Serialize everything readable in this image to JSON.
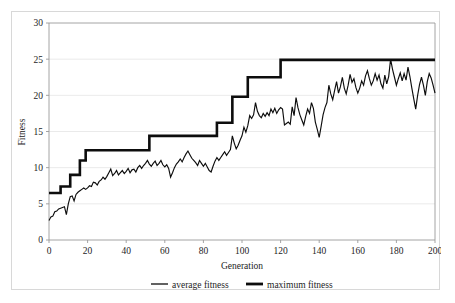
{
  "chart_data": {
    "type": "line",
    "title": "",
    "xlabel": "Generation",
    "ylabel": "Fitness",
    "xlim": [
      0,
      200
    ],
    "ylim": [
      0,
      30
    ],
    "xticks": [
      0,
      20,
      40,
      60,
      80,
      100,
      120,
      140,
      160,
      180,
      200
    ],
    "yticks": [
      0,
      5,
      10,
      15,
      20,
      25,
      30
    ],
    "grid": "horizontal",
    "legend_position": "bottom",
    "legend": [
      "average fitness",
      "maximum fitness"
    ],
    "x": [
      0,
      1,
      2,
      3,
      4,
      5,
      6,
      7,
      8,
      9,
      10,
      11,
      12,
      13,
      14,
      15,
      16,
      17,
      18,
      19,
      20,
      21,
      22,
      23,
      24,
      25,
      26,
      27,
      28,
      29,
      30,
      31,
      32,
      33,
      34,
      35,
      36,
      37,
      38,
      39,
      40,
      41,
      42,
      43,
      44,
      45,
      46,
      47,
      48,
      49,
      50,
      51,
      52,
      53,
      54,
      55,
      56,
      57,
      58,
      59,
      60,
      61,
      62,
      63,
      64,
      65,
      66,
      67,
      68,
      69,
      70,
      71,
      72,
      73,
      74,
      75,
      76,
      77,
      78,
      79,
      80,
      81,
      82,
      83,
      84,
      85,
      86,
      87,
      88,
      89,
      90,
      91,
      92,
      93,
      94,
      95,
      96,
      97,
      98,
      99,
      100,
      101,
      102,
      103,
      104,
      105,
      106,
      107,
      108,
      109,
      110,
      111,
      112,
      113,
      114,
      115,
      116,
      117,
      118,
      119,
      120,
      121,
      122,
      123,
      124,
      125,
      126,
      127,
      128,
      129,
      130,
      131,
      132,
      133,
      134,
      135,
      136,
      137,
      138,
      139,
      140,
      141,
      142,
      143,
      144,
      145,
      146,
      147,
      148,
      149,
      150,
      151,
      152,
      153,
      154,
      155,
      156,
      157,
      158,
      159,
      160,
      161,
      162,
      163,
      164,
      165,
      166,
      167,
      168,
      169,
      170,
      171,
      172,
      173,
      174,
      175,
      176,
      177,
      178,
      179,
      180,
      181,
      182,
      183,
      184,
      185,
      186,
      187,
      188,
      189,
      190,
      191,
      192,
      193,
      194,
      195,
      196,
      197,
      198,
      199,
      200
    ],
    "series": [
      {
        "name": "average fitness",
        "values": [
          2.7,
          3.2,
          3.3,
          3.9,
          4.0,
          4.3,
          4.4,
          4.5,
          4.6,
          3.5,
          5.0,
          6.0,
          6.1,
          5.4,
          6.3,
          6.6,
          6.8,
          7.0,
          7.2,
          7.0,
          7.2,
          7.5,
          7.4,
          8.0,
          7.9,
          7.6,
          8.1,
          8.3,
          8.7,
          8.4,
          8.8,
          9.3,
          9.8,
          8.9,
          9.2,
          9.6,
          9.0,
          9.3,
          9.6,
          9.2,
          9.5,
          9.9,
          9.3,
          9.7,
          9.8,
          9.4,
          10.0,
          10.3,
          9.9,
          10.3,
          10.6,
          11.0,
          10.5,
          10.2,
          10.6,
          10.9,
          10.3,
          10.6,
          11.0,
          10.4,
          10.1,
          10.4,
          9.9,
          8.7,
          9.3,
          10.0,
          10.5,
          10.8,
          11.2,
          10.8,
          11.4,
          11.9,
          12.3,
          11.8,
          11.3,
          11.0,
          10.7,
          10.3,
          11.0,
          10.6,
          10.2,
          10.6,
          10.1,
          9.6,
          9.4,
          10.2,
          10.9,
          11.4,
          11.0,
          11.4,
          11.8,
          12.2,
          11.7,
          12.1,
          12.5,
          14.4,
          13.4,
          12.6,
          13.1,
          13.8,
          14.4,
          15.6,
          14.9,
          15.8,
          17.2,
          16.8,
          17.3,
          19.0,
          17.8,
          17.2,
          16.9,
          17.5,
          17.1,
          17.6,
          17.2,
          18.1,
          17.6,
          18.2,
          17.5,
          18.0,
          18.3,
          18.1,
          15.9,
          16.1,
          16.3,
          16.0,
          18.4,
          17.2,
          19.7,
          18.3,
          17.3,
          16.6,
          15.9,
          17.1,
          18.1,
          17.5,
          19.0,
          18.2,
          16.3,
          15.3,
          14.2,
          15.7,
          17.3,
          18.3,
          19.0,
          21.4,
          20.2,
          19.4,
          20.7,
          21.9,
          20.3,
          21.2,
          22.5,
          21.0,
          20.2,
          21.4,
          22.9,
          21.8,
          22.3,
          21.1,
          20.3,
          21.0,
          22.0,
          21.4,
          22.7,
          23.4,
          22.3,
          21.4,
          22.0,
          23.0,
          22.1,
          22.8,
          21.6,
          21.0,
          22.8,
          21.6,
          22.6,
          25.0,
          23.6,
          22.5,
          21.4,
          22.3,
          23.1,
          22.0,
          23.0,
          22.1,
          23.9,
          22.6,
          21.0,
          19.5,
          18.1,
          20.0,
          21.5,
          22.5,
          21.4,
          20.0,
          21.9,
          23.0,
          22.4,
          21.4,
          20.3
        ],
        "style": "thin"
      },
      {
        "name": "maximum fitness",
        "values": [
          6.5,
          6.5,
          6.5,
          6.5,
          6.5,
          6.5,
          7.4,
          7.4,
          7.4,
          7.4,
          7.4,
          9.0,
          9.0,
          9.0,
          9.0,
          9.0,
          11.0,
          11.0,
          11.0,
          12.4,
          12.4,
          12.4,
          12.4,
          12.4,
          12.4,
          12.4,
          12.4,
          12.4,
          12.4,
          12.4,
          12.4,
          12.4,
          12.4,
          12.4,
          12.4,
          12.4,
          12.4,
          12.4,
          12.4,
          12.4,
          12.4,
          12.4,
          12.4,
          12.4,
          12.4,
          12.4,
          12.4,
          12.4,
          12.4,
          12.4,
          12.4,
          12.4,
          14.4,
          14.4,
          14.4,
          14.4,
          14.4,
          14.4,
          14.4,
          14.4,
          14.4,
          14.4,
          14.4,
          14.4,
          14.4,
          14.4,
          14.4,
          14.4,
          14.4,
          14.4,
          14.4,
          14.4,
          14.4,
          14.4,
          14.4,
          14.4,
          14.4,
          14.4,
          14.4,
          14.4,
          14.4,
          14.4,
          14.4,
          14.4,
          14.4,
          14.4,
          14.4,
          16.2,
          16.2,
          16.2,
          16.2,
          16.2,
          16.2,
          16.2,
          16.2,
          19.8,
          19.8,
          19.8,
          19.8,
          19.8,
          19.8,
          19.8,
          19.8,
          22.5,
          22.5,
          22.5,
          22.5,
          22.5,
          22.5,
          22.5,
          22.5,
          22.5,
          22.5,
          22.5,
          22.5,
          22.5,
          22.5,
          22.5,
          22.5,
          22.5,
          24.9,
          24.9,
          24.9,
          24.9,
          24.9,
          24.9,
          24.9,
          24.9,
          24.9,
          24.9,
          24.9,
          24.9,
          24.9,
          24.9,
          24.9,
          24.9,
          24.9,
          24.9,
          24.9,
          24.9,
          24.9,
          24.9,
          24.9,
          24.9,
          24.9,
          24.9,
          24.9,
          24.9,
          24.9,
          24.9,
          24.9,
          24.9,
          24.9,
          24.9,
          24.9,
          24.9,
          24.9,
          24.9,
          24.9,
          24.9,
          24.9,
          24.9,
          24.9,
          24.9,
          24.9,
          24.9,
          24.9,
          24.9,
          24.9,
          24.9,
          24.9,
          24.9,
          24.9,
          24.9,
          24.9,
          24.9,
          24.9,
          24.9,
          24.9,
          24.9,
          24.9,
          24.9,
          24.9,
          24.9,
          24.9,
          24.9,
          24.9,
          24.9,
          24.9,
          24.9,
          24.9,
          24.9,
          24.9,
          24.9,
          24.9,
          24.9,
          24.9,
          24.9,
          24.9,
          24.9,
          24.9
        ],
        "style": "thick"
      }
    ]
  },
  "axes": {
    "y_title": "Fitness",
    "x_title": "Generation",
    "y_tick_labels": [
      "0",
      "5",
      "10",
      "15",
      "20",
      "25",
      "30"
    ],
    "x_tick_labels": [
      "0",
      "20",
      "40",
      "60",
      "80",
      "100",
      "120",
      "140",
      "160",
      "180",
      "200"
    ]
  },
  "legend": {
    "items": [
      {
        "label": "average fitness",
        "marker": "thin-line",
        "color": "#0d0d0d"
      },
      {
        "label": "maximum fitness",
        "marker": "thick-line",
        "color": "#0d0d0d"
      }
    ]
  },
  "colors": {
    "series_line": "#0d0d0d",
    "gridline": "#e4e4e4",
    "axis": "#9a9a9a",
    "frame": "#d8d8d8",
    "background": "#ffffff"
  }
}
